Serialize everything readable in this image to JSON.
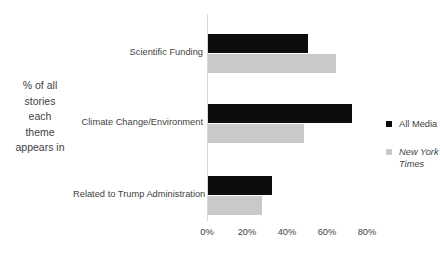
{
  "chart_data": {
    "type": "bar",
    "orientation": "horizontal",
    "title": "",
    "xlabel": "",
    "ylabel": "% of all stories\neach\ntheme\nappears in",
    "categories": [
      "Scientific Funding",
      "Climate Change/Environment",
      "Related to Trump Administration"
    ],
    "series": [
      {
        "name": "All Media",
        "color": "#0d0d0d",
        "values": [
          50,
          72,
          32
        ]
      },
      {
        "name": "New York Times",
        "color": "#c9c9c9",
        "values": [
          64,
          48,
          27
        ]
      }
    ],
    "xlim": [
      0,
      80
    ],
    "xticks": [
      "0%",
      "20%",
      "40%",
      "60%",
      "80%"
    ],
    "xtick_values": [
      0,
      20,
      40,
      60,
      80
    ],
    "grid": false,
    "legend_position": "right"
  },
  "axis": {
    "title_lines": "% of all\nstories\neach\ntheme\nappears in"
  },
  "legend": {
    "items": [
      {
        "label": "All Media",
        "style": "normal"
      },
      {
        "label": "New York Times",
        "style": "italic"
      }
    ]
  }
}
